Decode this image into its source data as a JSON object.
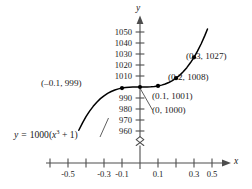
{
  "chart_data": {
    "type": "line",
    "title": "",
    "subtitle": "",
    "xlabel": "x",
    "ylabel": "y",
    "equation_label": "y = 1000(x³ + 1)",
    "equation_parts": {
      "lhs": "y",
      "equals": "=",
      "coef": "1000(",
      "var": "x",
      "exponent": "3",
      "tail": " + 1)"
    },
    "function": "y = 1000(x^3 + 1)",
    "grid": false,
    "legend": "none",
    "axis_break": true,
    "xlim": [
      -0.62,
      0.62
    ],
    "ylim": [
      955,
      1056
    ],
    "x_ticks": [
      -0.5,
      -0.4,
      -0.3,
      -0.2,
      -0.1,
      0.1,
      0.2,
      0.3,
      0.4,
      0.5
    ],
    "x_tick_labels": [
      "-0.5",
      "",
      "-0.3",
      "",
      "-0.1",
      "0.1",
      "",
      "0.3",
      "",
      "0.5"
    ],
    "y_ticks": [
      1050,
      1040,
      1030,
      1020,
      1010,
      1000,
      990,
      980,
      970,
      960
    ],
    "y_tick_labels": [
      "1050",
      "1040",
      "1030",
      "1020",
      "1010",
      "",
      "990",
      "980",
      "970",
      "960"
    ],
    "series": [
      {
        "name": "y = 1000(x^3 + 1)",
        "x": [
          -0.34,
          -0.32,
          -0.3,
          -0.28,
          -0.26,
          -0.24,
          -0.22,
          -0.2,
          -0.18,
          -0.16,
          -0.14,
          -0.12,
          -0.1,
          -0.08,
          -0.06,
          -0.04,
          -0.02,
          0.0,
          0.02,
          0.04,
          0.06,
          0.08,
          0.1,
          0.12,
          0.14,
          0.16,
          0.18,
          0.2,
          0.22,
          0.24,
          0.26,
          0.28,
          0.3,
          0.32,
          0.34,
          0.36,
          0.375
        ],
        "y": [
          960.7,
          967.2,
          973.0,
          978.1,
          982.4,
          986.2,
          989.4,
          992.0,
          994.2,
          995.9,
          997.3,
          998.3,
          999.0,
          999.5,
          999.8,
          999.9,
          1000.0,
          1000.0,
          1000.0,
          1000.1,
          1000.2,
          1000.5,
          1001.0,
          1001.7,
          1002.7,
          1004.1,
          1005.8,
          1008.0,
          1010.6,
          1013.8,
          1017.6,
          1022.0,
          1027.0,
          1032.8,
          1039.3,
          1046.7,
          1052.7
        ]
      }
    ],
    "labeled_points": [
      {
        "id": "pt-neg01",
        "x": -0.1,
        "y": 999,
        "label": "(–0.1, 999)",
        "anchor": "left"
      },
      {
        "id": "pt-zero",
        "x": 0.0,
        "y": 1000,
        "label": "(0, 1000)",
        "anchor": "below-right"
      },
      {
        "id": "pt-01",
        "x": 0.1,
        "y": 1001,
        "label": "(0.1, 1001)",
        "anchor": "right"
      },
      {
        "id": "pt-02",
        "x": 0.2,
        "y": 1008,
        "label": "(0.2, 1008)",
        "anchor": "right"
      },
      {
        "id": "pt-03",
        "x": 0.3,
        "y": 1027,
        "label": "(0.3, 1027)",
        "anchor": "right"
      }
    ],
    "colors": {
      "curve": "#000000",
      "axis": "#4d4d4d",
      "text": "#1a1a1a",
      "point": "#000000",
      "background": "#ffffff"
    }
  }
}
